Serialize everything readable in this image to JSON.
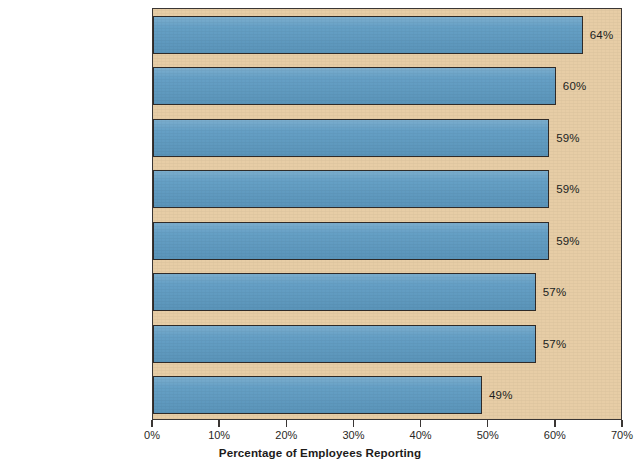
{
  "chart_data": {
    "type": "bar",
    "orientation": "horizontal",
    "title": "",
    "xlabel": "Percentage of Employees Reporting",
    "ylabel": "",
    "xlim": [
      0,
      70
    ],
    "xticks": [
      "0%",
      "10%",
      "20%",
      "30%",
      "40%",
      "50%",
      "60%",
      "70%"
    ],
    "xtick_values": [
      0,
      10,
      20,
      30,
      40,
      50,
      60,
      70
    ],
    "grid": false,
    "legend": false,
    "categories": [
      "Pressure to do whatever it takes to meet business targets",
      "Company's code of conduct not taken seriously",
      "Will be rewarded for results and not the means used to achieve them",
      "Unfamiliar with ethical standards that apply to the job",
      "Fear of losing job if business targets not met",
      "Believe policies are easy to override",
      "Lack resources to get the job done without taking shortcuts",
      "Seeking to bend rules for personal gain"
    ],
    "values": [
      64,
      60,
      59,
      59,
      59,
      57,
      57,
      49
    ],
    "value_labels": [
      "64%",
      "60%",
      "59%",
      "59%",
      "59%",
      "57%",
      "57%",
      "49%"
    ],
    "category_lines": [
      [
        "Pressure to do whatever it",
        "takes to meet business targets"
      ],
      [
        "Company's code of conduct",
        "not taken seriously"
      ],
      [
        "Will be rewarded for results and",
        "not the means used to achieve them"
      ],
      [
        "Unfamiliar with ethical standards",
        "that apply to the job"
      ],
      [
        "Fear of losing job if business",
        "targets not met"
      ],
      [
        "Believe policies are",
        "easy to override"
      ],
      [
        "Lack resources to get the job done",
        "without taking shortcuts"
      ],
      [
        "Seeking to bend rules",
        "for personal gain"
      ]
    ],
    "colors": {
      "bar_fill": "#5f9cc3",
      "bar_stroke": "#2f2b29",
      "plot_background": "#e7cda6",
      "page_background": "#ffffff",
      "text": "#2a2826"
    }
  }
}
